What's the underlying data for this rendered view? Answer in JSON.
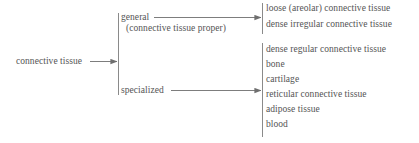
{
  "diagram": {
    "line_color": "#8a8a8a",
    "text_color": "#545454",
    "background_color": "#ffffff",
    "root": {
      "label": "connective tissue"
    },
    "branches": [
      {
        "label": "general",
        "sublabel": "(connective tissue proper)",
        "leaves": [
          "loose (areolar) connective tissue",
          "dense irregular connective tissue"
        ]
      },
      {
        "label": "specialized",
        "sublabel": "",
        "leaves": [
          "dense regular connective tissue",
          "bone",
          "cartilage",
          "reticular connective tissue",
          "adipose tissue",
          "blood"
        ]
      }
    ]
  }
}
